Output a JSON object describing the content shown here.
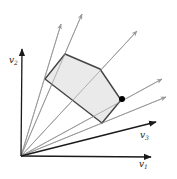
{
  "diagram": {
    "origin": [
      21,
      156
    ],
    "axes": [
      {
        "name": "v1",
        "label": "v",
        "subscript": "1",
        "end": [
          151,
          157
        ],
        "label_pos": [
          139,
          167
        ]
      },
      {
        "name": "v2",
        "label": "v",
        "subscript": "2",
        "end": [
          22,
          49
        ],
        "label_pos": [
          9,
          63
        ]
      },
      {
        "name": "v3",
        "label": "v",
        "subscript": "3",
        "end": [
          156,
          122
        ],
        "label_pos": [
          140,
          138
        ]
      }
    ],
    "rays": [
      {
        "end": [
          61,
          24
        ]
      },
      {
        "end": [
          82,
          14
        ]
      },
      {
        "end": [
          137,
          31
        ]
      },
      {
        "end": [
          162,
          79
        ]
      },
      {
        "end": [
          166,
          97
        ]
      }
    ],
    "polygon": {
      "points": [
        [
          45,
          79
        ],
        [
          65,
          54
        ],
        [
          100,
          69
        ],
        [
          121,
          100
        ],
        [
          102,
          123
        ]
      ],
      "fill": "#e6e6e6",
      "stroke": "#444444"
    },
    "highlight_point": {
      "at": [
        122,
        99
      ],
      "color": "#000000"
    },
    "colors": {
      "axis": "#1a1a1a",
      "ray": "#999999"
    }
  }
}
